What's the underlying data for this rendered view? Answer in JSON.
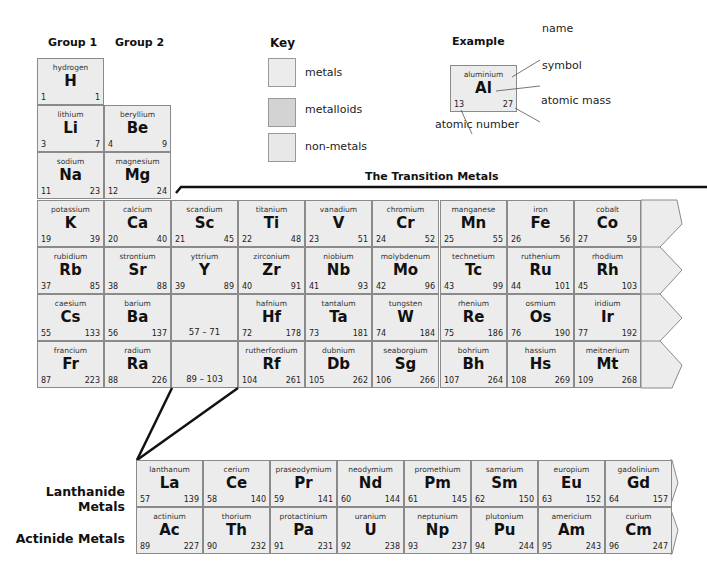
{
  "headers": {
    "group1": "Group 1",
    "group2": "Group 2",
    "key": "Key",
    "example": "Example",
    "transition": "The Transition Metals",
    "lanthanide": "Lanthanide Metals",
    "actinide": "Actinide Metals"
  },
  "key": [
    {
      "label": "metals",
      "color": "#ececec"
    },
    {
      "label": "metalloids",
      "color": "#d3d3d3"
    },
    {
      "label": "non-metals",
      "color": "#e8e8e8"
    }
  ],
  "example": {
    "name": "aluminium",
    "symbol": "Al",
    "number": "13",
    "mass": "27",
    "labels": {
      "name": "name",
      "symbol": "symbol",
      "mass": "atomic mass",
      "number": "atomic number"
    }
  },
  "main_table": [
    {
      "col": 0,
      "row": 0,
      "name": "hydrogen",
      "symbol": "H",
      "number": "1",
      "mass": "1"
    },
    {
      "col": 0,
      "row": 1,
      "name": "lithium",
      "symbol": "Li",
      "number": "3",
      "mass": "7"
    },
    {
      "col": 1,
      "row": 1,
      "name": "beryllium",
      "symbol": "Be",
      "number": "4",
      "mass": "9"
    },
    {
      "col": 0,
      "row": 2,
      "name": "sodium",
      "symbol": "Na",
      "number": "11",
      "mass": "23"
    },
    {
      "col": 1,
      "row": 2,
      "name": "magnesium",
      "symbol": "Mg",
      "number": "12",
      "mass": "24"
    },
    {
      "col": 0,
      "row": 3,
      "name": "potassium",
      "symbol": "K",
      "number": "19",
      "mass": "39"
    },
    {
      "col": 1,
      "row": 3,
      "name": "calcium",
      "symbol": "Ca",
      "number": "20",
      "mass": "40"
    },
    {
      "col": 2,
      "row": 3,
      "name": "scandium",
      "symbol": "Sc",
      "number": "21",
      "mass": "45"
    },
    {
      "col": 3,
      "row": 3,
      "name": "titanium",
      "symbol": "Ti",
      "number": "22",
      "mass": "48"
    },
    {
      "col": 4,
      "row": 3,
      "name": "vanadium",
      "symbol": "V",
      "number": "23",
      "mass": "51"
    },
    {
      "col": 5,
      "row": 3,
      "name": "chromium",
      "symbol": "Cr",
      "number": "24",
      "mass": "52"
    },
    {
      "col": 6,
      "row": 3,
      "name": "manganese",
      "symbol": "Mn",
      "number": "25",
      "mass": "55"
    },
    {
      "col": 7,
      "row": 3,
      "name": "iron",
      "symbol": "Fe",
      "number": "26",
      "mass": "56"
    },
    {
      "col": 8,
      "row": 3,
      "name": "cobalt",
      "symbol": "Co",
      "number": "27",
      "mass": "59"
    },
    {
      "col": 0,
      "row": 4,
      "name": "rubidium",
      "symbol": "Rb",
      "number": "37",
      "mass": "85"
    },
    {
      "col": 1,
      "row": 4,
      "name": "strontium",
      "symbol": "Sr",
      "number": "38",
      "mass": "88"
    },
    {
      "col": 2,
      "row": 4,
      "name": "yttrium",
      "symbol": "Y",
      "number": "39",
      "mass": "89"
    },
    {
      "col": 3,
      "row": 4,
      "name": "zirconium",
      "symbol": "Zr",
      "number": "40",
      "mass": "91"
    },
    {
      "col": 4,
      "row": 4,
      "name": "niobium",
      "symbol": "Nb",
      "number": "41",
      "mass": "93"
    },
    {
      "col": 5,
      "row": 4,
      "name": "molybdenum",
      "symbol": "Mo",
      "number": "42",
      "mass": "96"
    },
    {
      "col": 6,
      "row": 4,
      "name": "technetium",
      "symbol": "Tc",
      "number": "43",
      "mass": "99"
    },
    {
      "col": 7,
      "row": 4,
      "name": "ruthenium",
      "symbol": "Ru",
      "number": "44",
      "mass": "101"
    },
    {
      "col": 8,
      "row": 4,
      "name": "rhodium",
      "symbol": "Rh",
      "number": "45",
      "mass": "103"
    },
    {
      "col": 0,
      "row": 5,
      "name": "caesium",
      "symbol": "Cs",
      "number": "55",
      "mass": "133"
    },
    {
      "col": 1,
      "row": 5,
      "name": "barium",
      "symbol": "Ba",
      "number": "56",
      "mass": "137"
    },
    {
      "col": 2,
      "row": 5,
      "range": "57 – 71"
    },
    {
      "col": 3,
      "row": 5,
      "name": "hafnium",
      "symbol": "Hf",
      "number": "72",
      "mass": "178"
    },
    {
      "col": 4,
      "row": 5,
      "name": "tantalum",
      "symbol": "Ta",
      "number": "73",
      "mass": "181"
    },
    {
      "col": 5,
      "row": 5,
      "name": "tungsten",
      "symbol": "W",
      "number": "74",
      "mass": "184"
    },
    {
      "col": 6,
      "row": 5,
      "name": "rhenium",
      "symbol": "Re",
      "number": "75",
      "mass": "186"
    },
    {
      "col": 7,
      "row": 5,
      "name": "osmium",
      "symbol": "Os",
      "number": "76",
      "mass": "190"
    },
    {
      "col": 8,
      "row": 5,
      "name": "iridium",
      "symbol": "Ir",
      "number": "77",
      "mass": "192"
    },
    {
      "col": 0,
      "row": 6,
      "name": "francium",
      "symbol": "Fr",
      "number": "87",
      "mass": "223"
    },
    {
      "col": 1,
      "row": 6,
      "name": "radium",
      "symbol": "Ra",
      "number": "88",
      "mass": "226"
    },
    {
      "col": 2,
      "row": 6,
      "range": "89 – 103"
    },
    {
      "col": 3,
      "row": 6,
      "name": "rutherfordium",
      "symbol": "Rf",
      "number": "104",
      "mass": "261"
    },
    {
      "col": 4,
      "row": 6,
      "name": "dubnium",
      "symbol": "Db",
      "number": "105",
      "mass": "262"
    },
    {
      "col": 5,
      "row": 6,
      "name": "seaborgium",
      "symbol": "Sg",
      "number": "106",
      "mass": "266"
    },
    {
      "col": 6,
      "row": 6,
      "name": "bohrium",
      "symbol": "Bh",
      "number": "107",
      "mass": "264"
    },
    {
      "col": 7,
      "row": 6,
      "name": "hassium",
      "symbol": "Hs",
      "number": "108",
      "mass": "269"
    },
    {
      "col": 8,
      "row": 6,
      "name": "meitnerium",
      "symbol": "Mt",
      "number": "109",
      "mass": "268"
    }
  ],
  "lanthanides": [
    {
      "name": "lanthanum",
      "symbol": "La",
      "number": "57",
      "mass": "139"
    },
    {
      "name": "cerium",
      "symbol": "Ce",
      "number": "58",
      "mass": "140"
    },
    {
      "name": "praseodymium",
      "symbol": "Pr",
      "number": "59",
      "mass": "141"
    },
    {
      "name": "neodymium",
      "symbol": "Nd",
      "number": "60",
      "mass": "144"
    },
    {
      "name": "promethium",
      "symbol": "Pm",
      "number": "61",
      "mass": "145"
    },
    {
      "name": "samarium",
      "symbol": "Sm",
      "number": "62",
      "mass": "150"
    },
    {
      "name": "europium",
      "symbol": "Eu",
      "number": "63",
      "mass": "152"
    },
    {
      "name": "gadolinium",
      "symbol": "Gd",
      "number": "64",
      "mass": "157"
    }
  ],
  "actinides": [
    {
      "name": "actinium",
      "symbol": "Ac",
      "number": "89",
      "mass": "227"
    },
    {
      "name": "thorium",
      "symbol": "Th",
      "number": "90",
      "mass": "232"
    },
    {
      "name": "protactinium",
      "symbol": "Pa",
      "number": "91",
      "mass": "231"
    },
    {
      "name": "uranium",
      "symbol": "U",
      "number": "92",
      "mass": "238"
    },
    {
      "name": "neptunium",
      "symbol": "Np",
      "number": "93",
      "mass": "237"
    },
    {
      "name": "plutonium",
      "symbol": "Pu",
      "number": "94",
      "mass": "244"
    },
    {
      "name": "americium",
      "symbol": "Am",
      "number": "95",
      "mass": "243"
    },
    {
      "name": "curium",
      "symbol": "Cm",
      "number": "96",
      "mass": "247"
    }
  ]
}
